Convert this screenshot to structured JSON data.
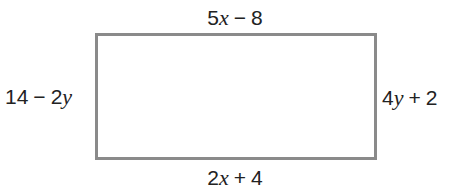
{
  "diagram": {
    "type": "rectangle",
    "border_color": "#8a8a8a",
    "sides": {
      "top": {
        "coef": "5",
        "var": "x",
        "op": "−",
        "const": "8"
      },
      "bottom": {
        "coef": "2",
        "var": "x",
        "op": "+",
        "const": "4"
      },
      "left": {
        "const": "14",
        "op": "−",
        "coef": "2",
        "var": "y"
      },
      "right": {
        "coef": "4",
        "var": "y",
        "op": "+",
        "const": "2"
      }
    }
  }
}
